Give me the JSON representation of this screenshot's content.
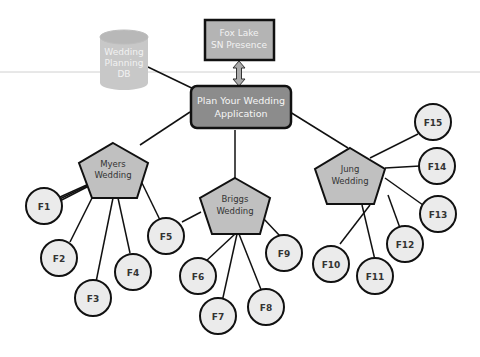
{
  "diagram": {
    "type": "hierarchy",
    "colors": {
      "app_fill": "#8c8c8c",
      "top_box_fill": "#b4b4b4",
      "db_fill": "#c8c8c8",
      "pentagon_fill": "#c0c0c0",
      "circle_fill": "#ebebeb",
      "stroke": "#111111",
      "light_text": "#f2f2f2",
      "dark_text": "#333333",
      "divider": "#c8c8c8"
    },
    "database": {
      "line1": "Wedding",
      "line2": "Planning",
      "line3": "DB"
    },
    "sn_box": {
      "line1": "Fox Lake",
      "line2": "SN Presence"
    },
    "app": {
      "line1": "Plan Your Wedding",
      "line2": "Application"
    },
    "weddings": [
      {
        "line1": "Myers",
        "line2": "Wedding",
        "features": [
          "F1",
          "F2",
          "F3",
          "F4",
          "F5"
        ]
      },
      {
        "line1": "Briggs",
        "line2": "Wedding",
        "features": [
          "F6",
          "F7",
          "F8",
          "F9"
        ]
      },
      {
        "line1": "Jung",
        "line2": "Wedding",
        "features": [
          "F10",
          "F11",
          "F12",
          "F13",
          "F14",
          "F15"
        ]
      }
    ],
    "features": {
      "f1": "F1",
      "f2": "F2",
      "f3": "F3",
      "f4": "F4",
      "f5": "F5",
      "f6": "F6",
      "f7": "F7",
      "f8": "F8",
      "f9": "F9",
      "f10": "F10",
      "f11": "F11",
      "f12": "F12",
      "f13": "F13",
      "f14": "F14",
      "f15": "F15"
    }
  }
}
